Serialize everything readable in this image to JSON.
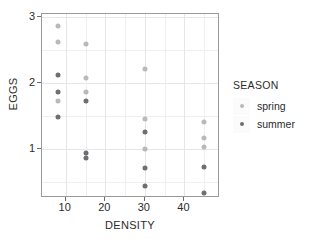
{
  "chart_data": {
    "type": "scatter",
    "title": "",
    "xlabel": "DENSITY",
    "ylabel": "EGGS",
    "xlim": [
      4,
      49
    ],
    "ylim": [
      0.25,
      3.05
    ],
    "xticks": [
      10,
      20,
      30,
      40
    ],
    "yticks": [
      1,
      2,
      3
    ],
    "xtick_labels": [
      "10",
      "20",
      "30",
      "40"
    ],
    "ytick_labels": [
      "1",
      "2",
      "3"
    ],
    "grid": true,
    "legend": {
      "title": "SEASON",
      "position": "right",
      "entries": [
        {
          "label": "spring",
          "color": "#b9b9bd"
        },
        {
          "label": "summer",
          "color": "#6e6e73"
        }
      ]
    },
    "series": [
      {
        "name": "spring",
        "color": "#b9b9bd",
        "points": [
          {
            "x": 8,
            "y": 2.87
          },
          {
            "x": 8,
            "y": 2.62
          },
          {
            "x": 8,
            "y": 1.73
          },
          {
            "x": 15,
            "y": 2.59
          },
          {
            "x": 15,
            "y": 2.07
          },
          {
            "x": 15,
            "y": 1.86
          },
          {
            "x": 30,
            "y": 2.22
          },
          {
            "x": 30,
            "y": 1.46
          },
          {
            "x": 30,
            "y": 1.0
          },
          {
            "x": 45,
            "y": 1.4
          },
          {
            "x": 45,
            "y": 1.17
          },
          {
            "x": 45,
            "y": 1.03
          }
        ]
      },
      {
        "name": "summer",
        "color": "#6e6e73",
        "points": [
          {
            "x": 8,
            "y": 2.12
          },
          {
            "x": 8,
            "y": 1.86
          },
          {
            "x": 8,
            "y": 1.49
          },
          {
            "x": 15,
            "y": 1.73
          },
          {
            "x": 15,
            "y": 0.94
          },
          {
            "x": 15,
            "y": 0.86
          },
          {
            "x": 30,
            "y": 1.25
          },
          {
            "x": 30,
            "y": 0.71
          },
          {
            "x": 30,
            "y": 0.43
          },
          {
            "x": 45,
            "y": 0.72
          },
          {
            "x": 45,
            "y": 0.32
          }
        ]
      }
    ],
    "gridlines_y_major": [
      1,
      2,
      3
    ],
    "gridlines_y_minor": [
      0.5,
      1.5,
      2.5
    ],
    "gridlines_x_major": [
      10,
      20,
      30,
      40
    ],
    "gridlines_x_minor": [
      15,
      25,
      35,
      45
    ]
  }
}
